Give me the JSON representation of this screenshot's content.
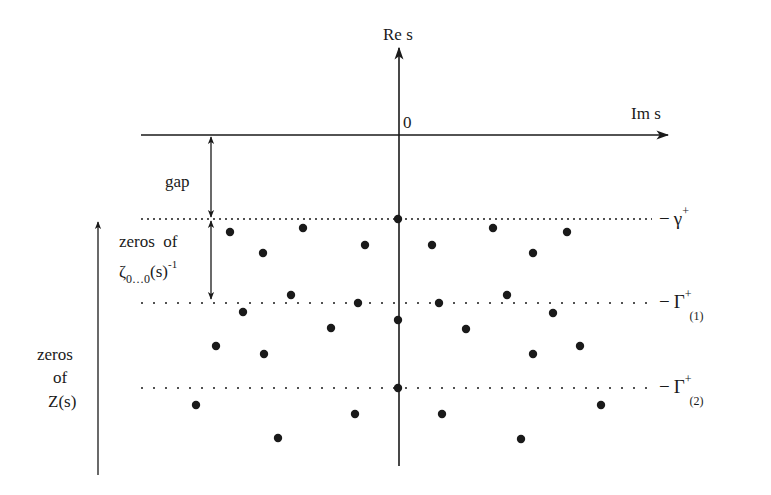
{
  "axes": {
    "vertical_label": "Re s",
    "horizontal_label": "Im s",
    "origin_label": "0"
  },
  "labels": {
    "gap": "gap",
    "zeta_zeros_line1": "zeros  of",
    "zeta_symbol": "ζ",
    "zeta_subscript": "0…0",
    "zeta_arg": "(s)",
    "zeta_exponent": "-1",
    "z_zeros_line1": "zeros",
    "z_zeros_line2": "of",
    "z_zeros_line3": "Z(s)"
  },
  "levels": [
    {
      "name": "gamma-plus",
      "dash": "−",
      "symbol": "γ",
      "superscript": "+",
      "subscript": ""
    },
    {
      "name": "Gamma-plus-1",
      "dash": "−",
      "symbol": "Γ",
      "superscript": "+",
      "subscript": "(1)"
    },
    {
      "name": "Gamma-plus-2",
      "dash": "−",
      "symbol": "Γ",
      "superscript": "+",
      "subscript": "(2)"
    }
  ],
  "colors": {
    "ink": "#1a1a1a",
    "background": "#ffffff"
  },
  "zeros": [
    [
      398,
      219
    ],
    [
      230,
      232
    ],
    [
      303,
      228
    ],
    [
      263,
      253
    ],
    [
      365,
      245
    ],
    [
      432,
      245
    ],
    [
      493,
      228
    ],
    [
      567,
      232
    ],
    [
      533,
      253
    ],
    [
      291,
      295
    ],
    [
      358,
      303
    ],
    [
      243,
      312
    ],
    [
      398,
      320
    ],
    [
      439,
      303
    ],
    [
      507,
      295
    ],
    [
      553,
      313
    ],
    [
      216,
      346
    ],
    [
      264,
      354
    ],
    [
      331,
      328
    ],
    [
      466,
      329
    ],
    [
      533,
      354
    ],
    [
      580,
      346
    ],
    [
      398,
      388
    ],
    [
      196,
      405
    ],
    [
      355,
      414
    ],
    [
      278,
      438
    ],
    [
      442,
      414
    ],
    [
      601,
      405
    ],
    [
      521,
      439
    ]
  ]
}
